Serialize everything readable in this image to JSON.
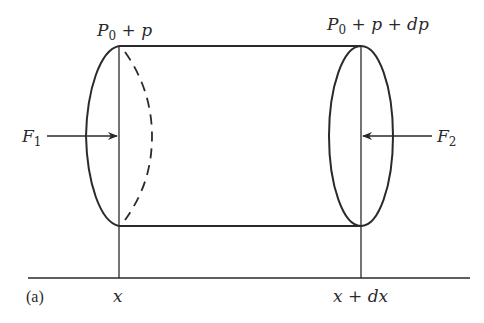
{
  "figure": {
    "panel_label": "(a)",
    "colors": {
      "ink": "#2a2a2a",
      "background": "#ffffff"
    }
  },
  "labels": {
    "left_pressure": {
      "base": "P",
      "sub": "0",
      "rest": " + p"
    },
    "right_pressure": {
      "base": "P",
      "sub": "0",
      "rest": " + p + dp"
    },
    "left_force": {
      "base": "F",
      "sub": "1"
    },
    "right_force": {
      "base": "F",
      "sub": "2"
    },
    "left_position": "x",
    "right_position": "x + dx"
  },
  "shapes": {
    "cylinder": {
      "left_x": 119,
      "right_x": 361,
      "top_y": 46,
      "bottom_y": 226
    },
    "axis": {
      "y": 278,
      "x_start": 28,
      "x_end": 470
    },
    "left_face": "half-ellipse solid (front) + dashed (back)",
    "right_face": "full ellipse solid",
    "arrows": [
      {
        "name": "F1",
        "from_x": 47,
        "to_x": 117,
        "y": 136,
        "direction": "right"
      },
      {
        "name": "F2",
        "from_x": 432,
        "to_x": 363,
        "y": 136,
        "direction": "left"
      }
    ]
  }
}
